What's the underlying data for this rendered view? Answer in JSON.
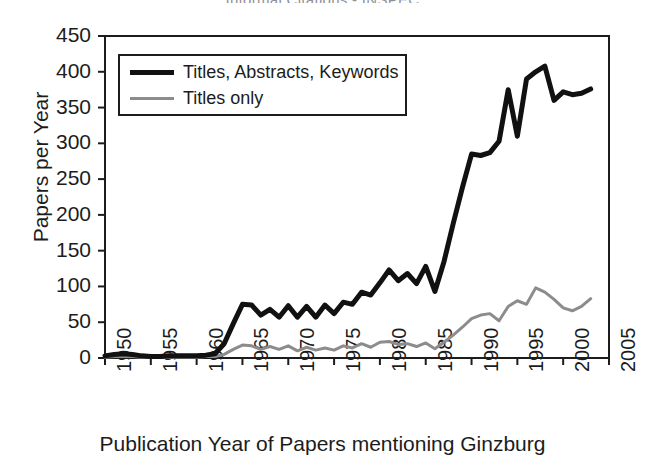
{
  "chart_data": {
    "type": "line",
    "title": "Informal Citations - INSPEC",
    "xlabel": "Publication Year of Papers mentioning Ginzburg",
    "ylabel": "Papers per Year",
    "xlim": [
      1950,
      2005
    ],
    "ylim": [
      0,
      450
    ],
    "xticks": [
      1950,
      1955,
      1960,
      1965,
      1970,
      1975,
      1980,
      1985,
      1990,
      1995,
      2000,
      2005
    ],
    "yticks": [
      0,
      50,
      100,
      150,
      200,
      250,
      300,
      350,
      400,
      450
    ],
    "grid": false,
    "legend_position": "upper-left",
    "x": [
      1950,
      1951,
      1952,
      1953,
      1954,
      1955,
      1956,
      1957,
      1958,
      1959,
      1960,
      1961,
      1962,
      1963,
      1964,
      1965,
      1966,
      1967,
      1968,
      1969,
      1970,
      1971,
      1972,
      1973,
      1974,
      1975,
      1976,
      1977,
      1978,
      1979,
      1980,
      1981,
      1982,
      1983,
      1984,
      1985,
      1986,
      1987,
      1988,
      1989,
      1990,
      1991,
      1992,
      1993,
      1994,
      1995,
      1996,
      1997,
      1998,
      1999,
      2000,
      2001,
      2002,
      2003
    ],
    "series": [
      {
        "name": "Titles, Abstracts, Keywords",
        "color": "#111111",
        "width": 5,
        "values": [
          3,
          5,
          6,
          5,
          3,
          2,
          2,
          3,
          3,
          3,
          3,
          4,
          6,
          20,
          48,
          75,
          74,
          60,
          68,
          57,
          73,
          57,
          72,
          57,
          74,
          62,
          78,
          75,
          92,
          88,
          105,
          123,
          108,
          118,
          104,
          128,
          93,
          135,
          188,
          238,
          285,
          283,
          287,
          303,
          375,
          310,
          390,
          400,
          408,
          360,
          372,
          368,
          370,
          376
        ]
      },
      {
        "name": "Titles only",
        "color": "#8c8c8c",
        "width": 3,
        "values": [
          1,
          2,
          2,
          2,
          1,
          1,
          1,
          1,
          1,
          1,
          1,
          2,
          2,
          5,
          12,
          18,
          17,
          12,
          16,
          12,
          17,
          10,
          15,
          11,
          14,
          11,
          17,
          14,
          20,
          15,
          22,
          23,
          19,
          20,
          16,
          21,
          13,
          22,
          32,
          43,
          55,
          60,
          62,
          52,
          72,
          80,
          75,
          98,
          92,
          82,
          70,
          66,
          72,
          83
        ]
      }
    ]
  },
  "legend": {
    "items": [
      {
        "label": "Titles, Abstracts, Keywords"
      },
      {
        "label": "Titles only"
      }
    ]
  }
}
